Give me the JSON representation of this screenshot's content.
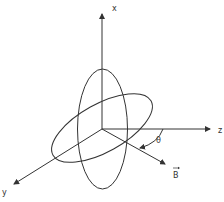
{
  "diagram": {
    "title": "",
    "axes": {
      "x_label": "x",
      "y_label": "y",
      "z_label": "z"
    },
    "vector_label": "B",
    "angle_label": "θ",
    "colors": {
      "ink": "#333333",
      "background": "#ffffff"
    }
  }
}
